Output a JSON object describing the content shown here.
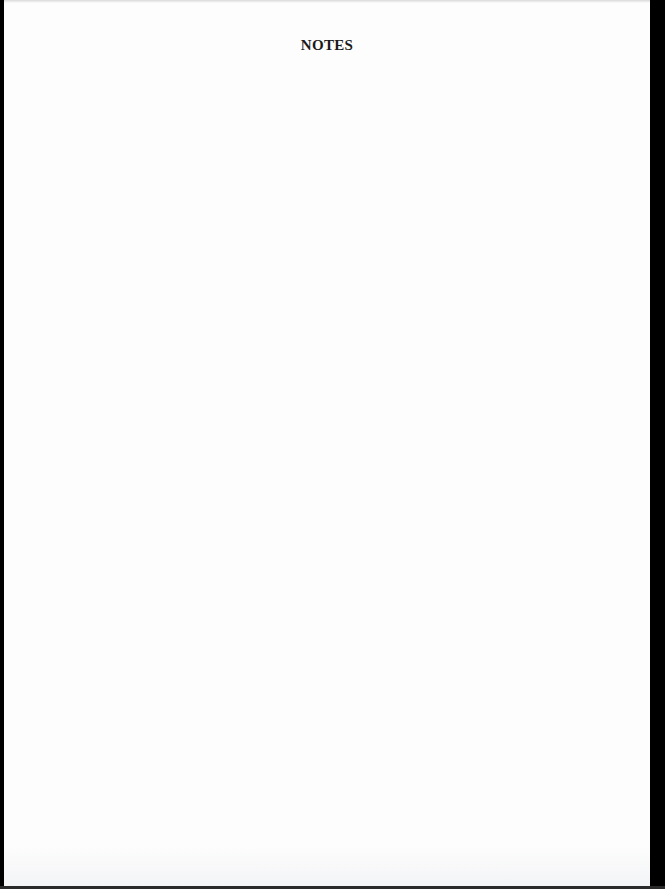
{
  "page": {
    "heading": "NOTES",
    "background_color": "#fdfdfd",
    "border_color": "#000000"
  }
}
